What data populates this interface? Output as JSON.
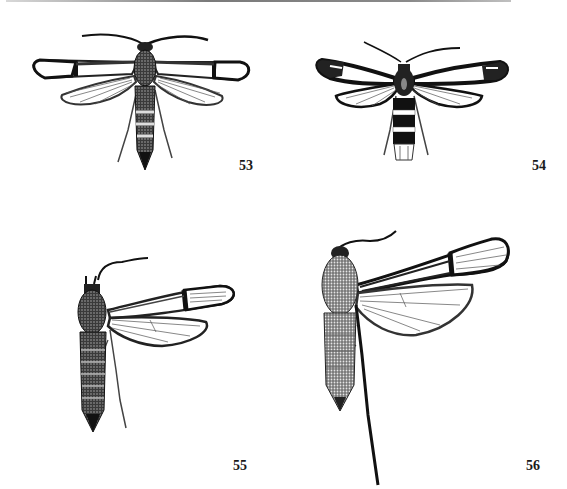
{
  "plate": {
    "figures": [
      {
        "number": "53",
        "subject": "moth-specimen",
        "pose": "dorsal, wings spread both sides"
      },
      {
        "number": "54",
        "subject": "moth-specimen",
        "pose": "dorsal, wings spread both sides, banded abdomen"
      },
      {
        "number": "55",
        "subject": "moth-specimen",
        "pose": "dorsal, right wings spread"
      },
      {
        "number": "56",
        "subject": "moth-specimen",
        "pose": "dorsal, right wings spread, long hind leg"
      }
    ]
  },
  "colors": {
    "ink": "#111111",
    "paper": "#ffffff",
    "wing_clear": "#ffffff",
    "shade": "#555555"
  }
}
